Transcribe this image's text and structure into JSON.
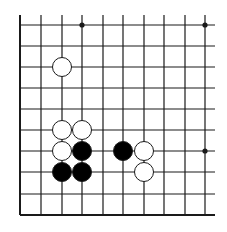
{
  "diagram": {
    "type": "go-board-fragment",
    "colors": {
      "background": "#ffffff",
      "line": "#1a1a1a",
      "black_stone": "#000000",
      "white_stone": "#ffffff",
      "stone_outline": "#1a1a1a"
    },
    "grid": {
      "x_lines": [
        20,
        41,
        62,
        82,
        103,
        123,
        144,
        164,
        185,
        205
      ],
      "y_lines": [
        25,
        46,
        67,
        88,
        109,
        130,
        151,
        172,
        194,
        215
      ],
      "top_extent": 15,
      "right_extent": 215,
      "bottom_edge": 215,
      "left_edge": 20
    },
    "star_points": [
      {
        "col": 3,
        "row": 0
      },
      {
        "col": 9,
        "row": 0
      },
      {
        "col": 9,
        "row": 6
      }
    ],
    "stones": [
      {
        "color": "white",
        "col": 2,
        "row": 2
      },
      {
        "color": "white",
        "col": 2,
        "row": 5
      },
      {
        "color": "white",
        "col": 3,
        "row": 5
      },
      {
        "color": "white",
        "col": 2,
        "row": 6
      },
      {
        "color": "black",
        "col": 3,
        "row": 6
      },
      {
        "color": "black",
        "col": 2,
        "row": 7
      },
      {
        "color": "black",
        "col": 3,
        "row": 7
      },
      {
        "color": "black",
        "col": 5,
        "row": 6
      },
      {
        "color": "white",
        "col": 6,
        "row": 6
      },
      {
        "color": "white",
        "col": 6,
        "row": 7
      }
    ],
    "stone_radius": 9.5
  }
}
